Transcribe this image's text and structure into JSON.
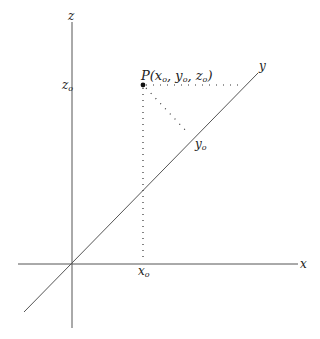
{
  "diagram": {
    "axes": {
      "x_label": "x",
      "y_label": "y",
      "z_label": "z"
    },
    "point": {
      "label_prefix": "P(",
      "x": "x",
      "y": "y",
      "z": "z",
      "sub": "o",
      "label_suffix": ")"
    },
    "ticks": {
      "z0_main": "z",
      "y0_main": "y",
      "x0_main": "x",
      "sub": "o"
    },
    "colors": {
      "axis": "#444444",
      "dots": "#333333",
      "point": "#111111"
    }
  }
}
